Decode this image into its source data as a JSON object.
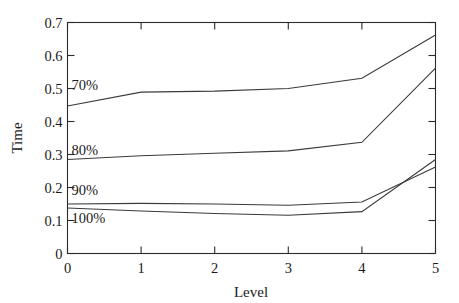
{
  "chart_data": {
    "type": "line",
    "title": "",
    "xlabel": "Level",
    "ylabel": "Time",
    "x": [
      0,
      1,
      2,
      3,
      4,
      5
    ],
    "xlim": [
      0,
      5
    ],
    "ylim": [
      0,
      0.7
    ],
    "grid": false,
    "legend_position": "inline-left",
    "xticks": [
      "0",
      "1",
      "2",
      "3",
      "4",
      "5"
    ],
    "yticks": [
      "0",
      "0.1",
      "0.2",
      "0.3",
      "0.4",
      "0.5",
      "0.6",
      "0.7"
    ],
    "series": [
      {
        "name": "70%",
        "label": "70%",
        "values": [
          0.447,
          0.489,
          0.492,
          0.5,
          0.531,
          0.662
        ]
      },
      {
        "name": "80%",
        "label": "80%",
        "values": [
          0.285,
          0.296,
          0.304,
          0.311,
          0.337,
          0.562
        ]
      },
      {
        "name": "90%",
        "label": "90%",
        "values": [
          0.15,
          0.152,
          0.15,
          0.146,
          0.156,
          0.262
        ]
      },
      {
        "name": "100%",
        "label": "100%",
        "values": [
          0.138,
          0.129,
          0.121,
          0.116,
          0.127,
          0.285
        ]
      }
    ]
  },
  "labels": {
    "y_axis_title": "Time",
    "x_axis_title": "Level"
  },
  "colors": {
    "line": "#3a3a3a",
    "axis": "#2b2b2b",
    "text": "#1a1a1a",
    "background": "#ffffff"
  }
}
